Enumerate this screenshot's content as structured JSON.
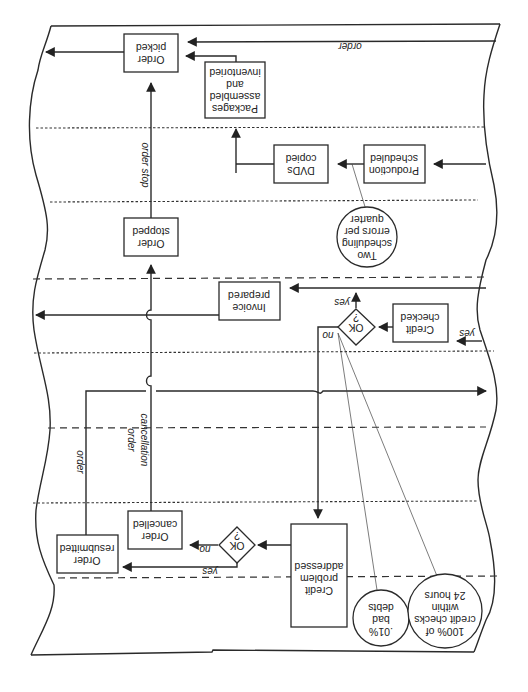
{
  "diagram": {
    "orientation": "rotated-180",
    "nodes": {
      "order_picked": {
        "line1": "Order",
        "line2": "picked"
      },
      "packages": {
        "line1": "Packages",
        "line2": "assembled",
        "line3": "and",
        "line4": "inventoried"
      },
      "dvds_copied": {
        "line1": "DVDs",
        "line2": "copied"
      },
      "production_scheduled": {
        "line1": "Production",
        "line2": "scheduled"
      },
      "order_stopped": {
        "line1": "Order",
        "line2": "stopped"
      },
      "invoice_prepared": {
        "line1": "Invoice",
        "line2": "prepared"
      },
      "credit_checked": {
        "line1": "Credit",
        "line2": "checked"
      },
      "ok_decision_1": {
        "line1": "OK",
        "line2": "?"
      },
      "credit_problem": {
        "line1": "Credit",
        "line2": "problem",
        "line3": "addressed"
      },
      "ok_decision_2": {
        "line1": "OK",
        "line2": "?"
      },
      "order_cancelled": {
        "line1": "Order",
        "line2": "cancelled"
      },
      "order_resubmitted": {
        "line1": "Order",
        "line2": "resubmitted"
      }
    },
    "metrics": {
      "scheduling_errors": {
        "line1": "Two",
        "line2": "scheduling",
        "line3": "errors per",
        "line4": "quarter"
      },
      "bad_debts": {
        "line1": ".01%",
        "line2": "bad",
        "line3": "debts"
      },
      "credit_checks": {
        "line1": "100% of",
        "line2": "credit checks",
        "line3": "within",
        "line4": "24 hours"
      }
    },
    "edge_labels": {
      "order_top": "order",
      "order_stop": "order stop",
      "order_cancellation_1": "order",
      "order_cancellation_2": "cancellation",
      "order_resubmit": "order",
      "yes_credit_in": "yes",
      "yes_ok1": "yes",
      "no_ok1": "no",
      "yes_ok2": "yes",
      "no_ok2": "no"
    }
  }
}
